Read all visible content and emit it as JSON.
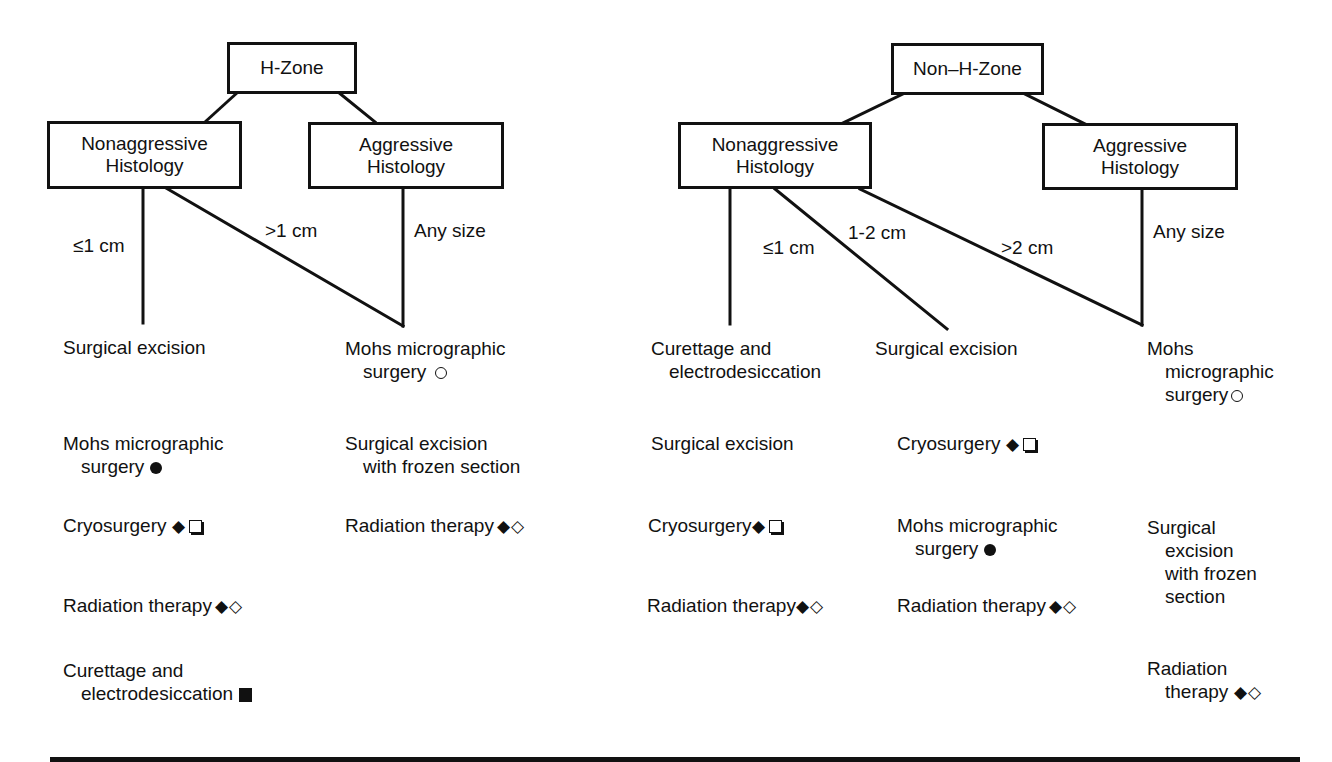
{
  "diagram": {
    "left_tree": {
      "root": "H-Zone",
      "nonaggressive": {
        "line1": "Nonaggressive",
        "line2": "Histology"
      },
      "aggressive": {
        "line1": "Aggressive",
        "line2": "Histology"
      },
      "branch_labels": {
        "small": "≤1 cm",
        "large": ">1 cm",
        "aggressive": "Any size"
      },
      "columns": [
        {
          "branch": "≤1 cm",
          "options": [
            {
              "line1": "Surgical excision",
              "symbols": []
            },
            {
              "line1": "Mohs micrographic",
              "line2": "surgery",
              "symbols": [
                "filled-circle"
              ]
            },
            {
              "line1": "Cryosurgery",
              "symbols": [
                "filled-diamond",
                "shadowed-square"
              ]
            },
            {
              "line1": "Radiation therapy",
              "symbols": [
                "filled-diamond",
                "open-diamond"
              ]
            },
            {
              "line1": "Curettage and",
              "line2": "electrodesiccation",
              "symbols": [
                "filled-square"
              ]
            }
          ]
        },
        {
          "branch": ">1 cm / Any size",
          "options": [
            {
              "line1": "Mohs micrographic",
              "line2": "surgery",
              "symbols": [
                "open-circle"
              ]
            },
            {
              "line1": "Surgical excision",
              "line2": "with frozen section",
              "symbols": []
            },
            {
              "line1": "Radiation therapy",
              "symbols": [
                "filled-diamond",
                "open-diamond"
              ]
            }
          ]
        }
      ]
    },
    "right_tree": {
      "root": "Non–H-Zone",
      "nonaggressive": {
        "line1": "Nonaggressive",
        "line2": "Histology"
      },
      "aggressive": {
        "line1": "Aggressive",
        "line2": "Histology"
      },
      "branch_labels": {
        "small": "≤1 cm",
        "medium": "1-2 cm",
        "large": ">2 cm",
        "aggressive": "Any size"
      },
      "columns": [
        {
          "branch": "≤1 cm",
          "options": [
            {
              "line1": "Curettage and",
              "line2": "electrodesiccation",
              "symbols": []
            },
            {
              "line1": "Surgical excision",
              "symbols": []
            },
            {
              "line1": "Cryosurgery",
              "symbols": [
                "filled-diamond",
                "shadowed-square"
              ]
            },
            {
              "line1": "Radiation therapy",
              "symbols": [
                "filled-diamond",
                "open-diamond"
              ]
            }
          ]
        },
        {
          "branch": "1-2 cm",
          "options": [
            {
              "line1": "Surgical excision",
              "symbols": []
            },
            {
              "line1": "Cryosurgery",
              "symbols": [
                "filled-diamond",
                "shadowed-square"
              ]
            },
            {
              "line1": "Mohs micrographic",
              "line2": "surgery",
              "symbols": [
                "filled-circle"
              ]
            },
            {
              "line1": "Radiation therapy",
              "symbols": [
                "filled-diamond",
                "open-diamond"
              ]
            }
          ]
        },
        {
          "branch": ">2 cm / Any size",
          "options": [
            {
              "line1": "Mohs",
              "line2": "micrographic",
              "line3": "surgery",
              "symbols": [
                "open-circle"
              ]
            },
            {
              "line1": "Surgical",
              "line2": "excision",
              "line3": "with frozen",
              "line4": "section",
              "symbols": []
            },
            {
              "line1": "Radiation",
              "line2": "therapy",
              "symbols": [
                "filled-diamond",
                "open-diamond"
              ]
            }
          ]
        }
      ]
    },
    "symbols": {
      "filled-diamond": "◆",
      "open-diamond": "◇",
      "filled-circle": "●",
      "open-circle": "○",
      "filled-square": "■",
      "shadowed-square": "❏"
    }
  }
}
